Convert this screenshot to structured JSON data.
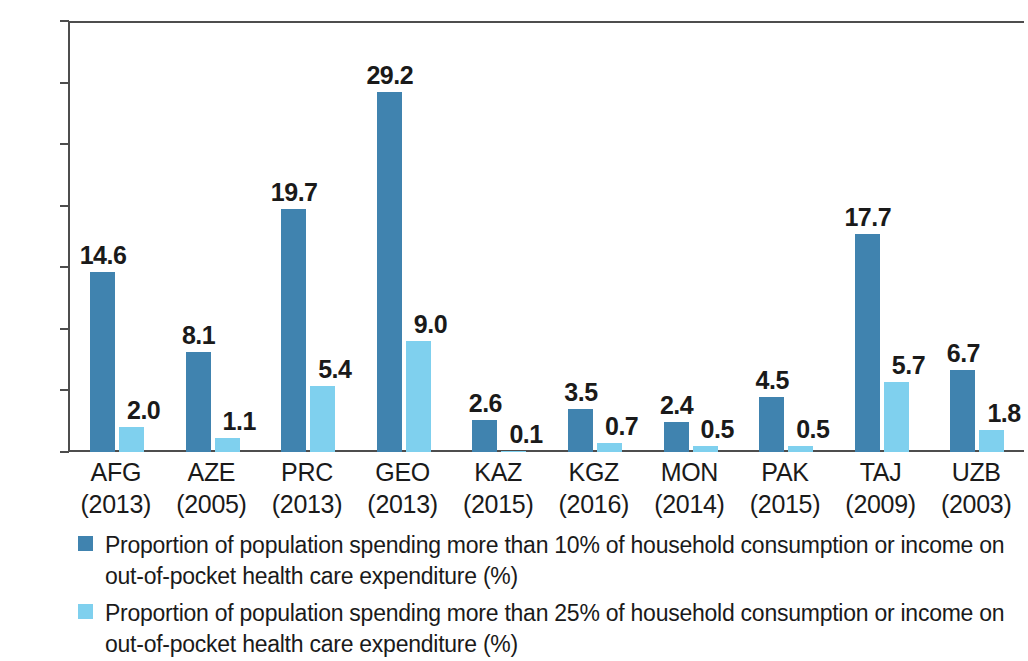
{
  "chart_data": {
    "type": "bar",
    "title": "",
    "subtitle": "",
    "xlabel": "",
    "ylabel": "",
    "ylim": [
      0,
      35
    ],
    "ytick_step": 5,
    "ytick_labels": [
      "0.0",
      "5.0",
      "10.0",
      "15.0",
      "20.0",
      "25.0",
      "30.0",
      "35.0"
    ],
    "grid": false,
    "legend_position": "bottom-left",
    "categories": [
      "AFG",
      "AZE",
      "PRC",
      "GEO",
      "KAZ",
      "KGZ",
      "MON",
      "PAK",
      "TAJ",
      "UZB"
    ],
    "category_years": [
      "(2013)",
      "(2005)",
      "(2013)",
      "(2013)",
      "(2015)",
      "(2016)",
      "(2014)",
      "(2015)",
      "(2009)",
      "(2003)"
    ],
    "series": [
      {
        "name": "Proportion of population spending more than 10% of household consumption or income on out-of-pocket health care expenditure (%)",
        "color": "#4083AF",
        "values": [
          14.6,
          8.1,
          19.7,
          29.2,
          2.6,
          3.5,
          2.4,
          4.5,
          17.7,
          6.7
        ],
        "value_labels": [
          "14.6",
          "8.1",
          "19.7",
          "29.2",
          "2.6",
          "3.5",
          "2.4",
          "4.5",
          "17.7",
          "6.7"
        ]
      },
      {
        "name": "Proportion of population spending more than 25% of household consumption or income on out-of-pocket health care expenditure (%)",
        "color": "#7FD0EE",
        "values": [
          2.0,
          1.1,
          5.4,
          9.0,
          0.1,
          0.7,
          0.5,
          0.5,
          5.7,
          1.8
        ],
        "value_labels": [
          "2.0",
          "1.1",
          "5.4",
          "9.0",
          "0.1",
          "0.7",
          "0.5",
          "0.5",
          "5.7",
          "1.8"
        ]
      }
    ]
  },
  "legend": {
    "entries": [
      {
        "color": "#4083AF",
        "line1": "Proportion of population spending more than 10% of household consumption or income on",
        "line2": "out-of-pocket health care expenditure (%)"
      },
      {
        "color": "#7FD0EE",
        "line1": "Proportion of population spending more than 25% of household consumption or income on",
        "line2": "out-of-pocket health care expenditure (%)"
      }
    ]
  },
  "colors": {
    "series_1": "#4083AF",
    "series_2": "#7FD0EE",
    "axis": "#4d4d4d",
    "text": "#1a1a1a",
    "background": "#ffffff"
  }
}
